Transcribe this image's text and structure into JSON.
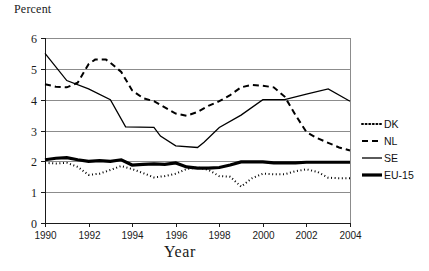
{
  "chart_data": {
    "type": "line",
    "title": "",
    "xlabel": "Year",
    "ylabel": "Percent",
    "ylim": [
      0,
      6
    ],
    "xlim": [
      1990,
      2004
    ],
    "ytick_labels": [
      "0",
      "1",
      "2",
      "3",
      "4",
      "5",
      "6"
    ],
    "ytick_values": [
      0,
      1,
      2,
      3,
      4,
      5,
      6
    ],
    "xtick_labels": [
      "1990",
      "1992",
      "1994",
      "1996",
      "1998",
      "2000",
      "2002",
      "2004"
    ],
    "xtick_values": [
      1990,
      1992,
      1994,
      1996,
      1998,
      2000,
      2002,
      2004
    ],
    "x": [
      1990,
      1991,
      1992,
      1993,
      1994,
      1995,
      1996,
      1997,
      1998,
      1999,
      2000,
      2001,
      2002,
      2003,
      2004
    ],
    "grid": "horizontal",
    "legend_position": "right",
    "series": [
      {
        "name": "DK",
        "style": "dotted",
        "color": "#000000",
        "width": 2.0,
        "dash": "1,2.6",
        "values": [
          1.95,
          1.93,
          1.56,
          1.72,
          1.9,
          1.62,
          1.5,
          1.45,
          1.78,
          1.8,
          1.52,
          1.5,
          1.55,
          1.62,
          1.48
        ]
      },
      {
        "name": "NL",
        "style": "dashed",
        "color": "#000000",
        "width": 2.0,
        "dash": "6,4",
        "values": [
          4.5,
          4.4,
          4.6,
          5.3,
          5.2,
          4.45,
          4.0,
          3.6,
          3.55,
          3.8,
          4.1,
          4.35,
          4.45,
          4.4,
          4.25
        ]
      },
      {
        "name": "SE",
        "style": "solid",
        "color": "#000000",
        "width": 1.3,
        "dash": "",
        "values": [
          5.5,
          5.0,
          4.55,
          4.2,
          4.1,
          3.6,
          3.1,
          3.1,
          2.75,
          2.5,
          2.5,
          2.45,
          2.85,
          3.2,
          3.55
        ]
      },
      {
        "name": "EU-15",
        "style": "thick-solid",
        "color": "#000000",
        "width": 3.2,
        "dash": "",
        "values": [
          2.05,
          2.08,
          2.12,
          2.05,
          2.0,
          2.05,
          2.07,
          1.9,
          1.88,
          1.92,
          1.95,
          1.85,
          1.8,
          1.78,
          1.75
        ]
      }
    ],
    "series_points": {
      "DK": [
        [
          1990,
          1.95
        ],
        [
          1990.5,
          1.93
        ],
        [
          1991,
          1.95
        ],
        [
          1991.5,
          1.82
        ],
        [
          1992,
          1.56
        ],
        [
          1992.5,
          1.6
        ],
        [
          1993,
          1.72
        ],
        [
          1993.5,
          1.85
        ],
        [
          1994,
          1.75
        ],
        [
          1994.5,
          1.62
        ],
        [
          1995,
          1.48
        ],
        [
          1995.5,
          1.52
        ],
        [
          1996,
          1.6
        ],
        [
          1996.5,
          1.75
        ],
        [
          1997,
          1.8
        ],
        [
          1997.5,
          1.72
        ],
        [
          1998,
          1.52
        ],
        [
          1998.5,
          1.5
        ],
        [
          1999,
          1.18
        ],
        [
          1999.5,
          1.45
        ],
        [
          2000,
          1.6
        ],
        [
          2000.5,
          1.58
        ],
        [
          2001,
          1.58
        ],
        [
          2001.5,
          1.68
        ],
        [
          2002,
          1.74
        ],
        [
          2002.5,
          1.66
        ],
        [
          2003,
          1.47
        ],
        [
          2003.5,
          1.45
        ],
        [
          2004,
          1.45
        ]
      ],
      "NL": [
        [
          1990,
          4.5
        ],
        [
          1990.5,
          4.42
        ],
        [
          1991,
          4.4
        ],
        [
          1991.5,
          4.55
        ],
        [
          1992,
          5.15
        ],
        [
          1992.3,
          5.3
        ],
        [
          1992.8,
          5.3
        ],
        [
          1993,
          5.2
        ],
        [
          1993.5,
          4.9
        ],
        [
          1994,
          4.3
        ],
        [
          1994.5,
          4.05
        ],
        [
          1995,
          3.95
        ],
        [
          1995.5,
          3.75
        ],
        [
          1996,
          3.55
        ],
        [
          1996.5,
          3.48
        ],
        [
          1997,
          3.6
        ],
        [
          1997.5,
          3.8
        ],
        [
          1998,
          3.95
        ],
        [
          1998.5,
          4.15
        ],
        [
          1999,
          4.4
        ],
        [
          1999.5,
          4.48
        ],
        [
          2000,
          4.45
        ],
        [
          2000.5,
          4.4
        ],
        [
          2001,
          4.1
        ],
        [
          2001.5,
          3.5
        ],
        [
          2002,
          2.95
        ],
        [
          2002.5,
          2.75
        ],
        [
          2003,
          2.6
        ],
        [
          2003.5,
          2.45
        ],
        [
          2004,
          2.35
        ]
      ],
      "SE": [
        [
          1990,
          5.5
        ],
        [
          1991,
          4.62
        ],
        [
          1992,
          4.35
        ],
        [
          1993,
          4.0
        ],
        [
          1993.7,
          3.12
        ],
        [
          1995,
          3.1
        ],
        [
          1995.3,
          2.82
        ],
        [
          1996,
          2.5
        ],
        [
          1997,
          2.45
        ],
        [
          1997.3,
          2.62
        ],
        [
          1998,
          3.1
        ],
        [
          1999,
          3.5
        ],
        [
          2000,
          4.0
        ],
        [
          2001,
          4.0
        ],
        [
          2002,
          4.18
        ],
        [
          2003,
          4.35
        ],
        [
          2004,
          3.95
        ]
      ],
      "EU-15": [
        [
          1990,
          2.05
        ],
        [
          1990.5,
          2.1
        ],
        [
          1991,
          2.12
        ],
        [
          1991.5,
          2.05
        ],
        [
          1992,
          2.0
        ],
        [
          1992.5,
          2.02
        ],
        [
          1993,
          2.0
        ],
        [
          1993.5,
          2.05
        ],
        [
          1994,
          1.88
        ],
        [
          1994.5,
          1.9
        ],
        [
          1995,
          1.92
        ],
        [
          1995.5,
          1.9
        ],
        [
          1996,
          1.95
        ],
        [
          1996.5,
          1.82
        ],
        [
          1997,
          1.78
        ],
        [
          1997.5,
          1.78
        ],
        [
          1998,
          1.8
        ],
        [
          1998.5,
          1.88
        ],
        [
          1999,
          1.98
        ],
        [
          1999.5,
          1.98
        ],
        [
          2000,
          1.98
        ],
        [
          2000.5,
          1.95
        ],
        [
          2001,
          1.95
        ],
        [
          2001.5,
          1.95
        ],
        [
          2002,
          1.97
        ],
        [
          2002.5,
          1.97
        ],
        [
          2003,
          1.97
        ],
        [
          2003.5,
          1.97
        ],
        [
          2004,
          1.97
        ]
      ]
    }
  },
  "legend": {
    "items": [
      {
        "label": "DK"
      },
      {
        "label": "NL"
      },
      {
        "label": "SE"
      },
      {
        "label": "EU-15"
      }
    ]
  }
}
